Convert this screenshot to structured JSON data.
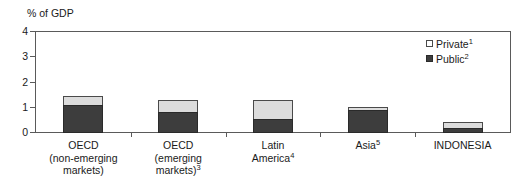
{
  "chart_data": {
    "type": "bar",
    "title": "",
    "subtitle": "",
    "xlabel": "",
    "ylabel": "% of GDP",
    "ylim": [
      0,
      4
    ],
    "yticks": [
      0,
      1,
      2,
      3,
      4
    ],
    "ytick_labels": [
      "0",
      "1",
      "2",
      "3",
      "4"
    ],
    "grid": false,
    "stacked": true,
    "legend_position": "top-right",
    "categories": [
      "OECD (non-emerging markets)",
      "OECD (emerging markets)3",
      "Latin America4",
      "Asia5",
      "INDONESIA"
    ],
    "series": [
      {
        "name": "Public2",
        "values": [
          1.1,
          0.85,
          0.55,
          0.9,
          0.2
        ],
        "color": "#3d3d3d"
      },
      {
        "name": "Private1",
        "values": [
          0.35,
          0.45,
          0.75,
          0.15,
          0.25
        ],
        "color": "#dcdcdc"
      }
    ],
    "totals": [
      1.45,
      1.3,
      1.3,
      1.05,
      0.45
    ]
  },
  "axis": {
    "unit_title": "% of GDP",
    "y_ticks": [
      {
        "label": "4",
        "value": 4
      },
      {
        "label": "3",
        "value": 3
      },
      {
        "label": "2",
        "value": 2
      },
      {
        "label": "1",
        "value": 1
      },
      {
        "label": "0",
        "value": 0
      }
    ]
  },
  "categories": [
    {
      "id": "oecd-non-emerging",
      "lines": [
        "OECD",
        "(non-emerging",
        "markets)"
      ],
      "superscript": "",
      "public": 1.1,
      "private": 0.35,
      "total": 1.45
    },
    {
      "id": "oecd-emerging",
      "lines": [
        "OECD",
        "(emerging",
        "markets)"
      ],
      "superscript": "3",
      "public": 0.85,
      "private": 0.45,
      "total": 1.3
    },
    {
      "id": "latin-america",
      "lines": [
        "Latin",
        "America"
      ],
      "superscript": "4",
      "public": 0.55,
      "private": 0.75,
      "total": 1.3
    },
    {
      "id": "asia",
      "lines": [
        "Asia"
      ],
      "superscript": "5",
      "public": 0.9,
      "private": 0.15,
      "total": 1.05
    },
    {
      "id": "indonesia",
      "lines": [
        "INDONESIA"
      ],
      "superscript": "",
      "public": 0.2,
      "private": 0.25,
      "total": 0.45
    }
  ],
  "legend": {
    "items": [
      {
        "id": "private",
        "label": "Private",
        "superscript": "1",
        "color": "#ffffff"
      },
      {
        "id": "public",
        "label": "Public",
        "superscript": "2",
        "color": "#3d3d3d"
      }
    ]
  },
  "colors": {
    "private_fill": "#dcdcdc",
    "public_fill": "#3d3d3d",
    "frame": "#5a5a5a",
    "text": "#1a1a1a",
    "background": "#ffffff"
  }
}
